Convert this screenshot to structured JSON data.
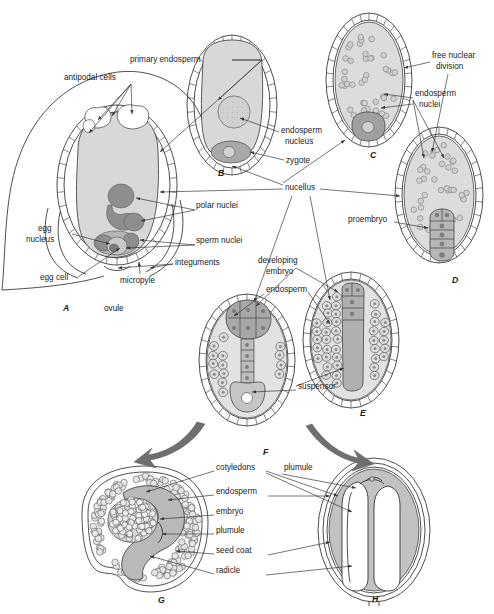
{
  "figure": {
    "panel_count": 8
  },
  "colors": {
    "background": "#ffffff",
    "ink": "#1a1a1a",
    "cytoplasm_light": "#d8d8d6",
    "cytoplasm_mid": "#c4c4c2",
    "nucleus_dark": "#8e8e8e",
    "nucleus_darker": "#777777",
    "cellwall": "#ffffff",
    "arrow_gray": "#6f6f6f",
    "leader": "#3a3a3a"
  },
  "panels": [
    {
      "id": "A",
      "label": "A",
      "x": 63,
      "y": 311,
      "caption": "ovule with mature embryo sac"
    },
    {
      "id": "B",
      "label": "B",
      "x": 218,
      "y": 176,
      "caption": "zygote and primary endosperm"
    },
    {
      "id": "C",
      "label": "C",
      "x": 370,
      "y": 158,
      "caption": "free nuclear endosperm"
    },
    {
      "id": "D",
      "label": "D",
      "x": 452,
      "y": 283,
      "caption": "proembryo stage"
    },
    {
      "id": "E",
      "label": "E",
      "x": 360,
      "y": 416,
      "caption": "elongating embryo"
    },
    {
      "id": "F",
      "label": "F",
      "x": 263,
      "y": 455,
      "caption": "embryo with suspensor"
    },
    {
      "id": "G",
      "label": "G",
      "x": 158,
      "y": 603,
      "caption": "mature seed, curved embryo"
    },
    {
      "id": "H",
      "label": "H",
      "x": 372,
      "y": 602,
      "caption": "mature seed, straight embryo"
    }
  ],
  "labels": [
    {
      "name": "antipodal-cells",
      "text": "antipodal cells",
      "x": 64,
      "y": 80,
      "anchor": "start"
    },
    {
      "name": "primary-endosperm",
      "text": "primary endosperm",
      "x": 130,
      "y": 62,
      "anchor": "start"
    },
    {
      "name": "free-nuclear-division-1",
      "text": "free nuclear",
      "x": 432,
      "y": 58,
      "anchor": "start"
    },
    {
      "name": "free-nuclear-division-2",
      "text": "division",
      "x": 436,
      "y": 69,
      "anchor": "start"
    },
    {
      "name": "endosperm-nuclei-1",
      "text": "endosperm",
      "x": 415,
      "y": 96,
      "anchor": "start"
    },
    {
      "name": "endosperm-nuclei-2",
      "text": "nuclei",
      "x": 419,
      "y": 107,
      "anchor": "start"
    },
    {
      "name": "endosperm-nucleus-1",
      "text": "endosperm",
      "x": 281,
      "y": 133,
      "anchor": "start"
    },
    {
      "name": "endosperm-nucleus-2",
      "text": "nucleus",
      "x": 285,
      "y": 144,
      "anchor": "start"
    },
    {
      "name": "zygote",
      "text": "zygote",
      "x": 286,
      "y": 163,
      "anchor": "start"
    },
    {
      "name": "nucellus",
      "text": "nucellus",
      "x": 285,
      "y": 190,
      "anchor": "start"
    },
    {
      "name": "polar-nuclei",
      "text": "polar nuclei",
      "x": 196,
      "y": 208,
      "anchor": "start"
    },
    {
      "name": "sperm-nuclei",
      "text": "sperm nuclei",
      "x": 196,
      "y": 243,
      "anchor": "start"
    },
    {
      "name": "egg-nucleus-1",
      "text": "egg",
      "x": 38,
      "y": 231,
      "anchor": "start"
    },
    {
      "name": "egg-nucleus-2",
      "text": "nucleus",
      "x": 26,
      "y": 242,
      "anchor": "start"
    },
    {
      "name": "egg-cell",
      "text": "egg cell",
      "x": 40,
      "y": 280,
      "anchor": "start"
    },
    {
      "name": "micropyle",
      "text": "micropyle",
      "x": 120,
      "y": 283,
      "anchor": "start"
    },
    {
      "name": "integuments",
      "text": "integuments",
      "x": 175,
      "y": 265,
      "anchor": "start"
    },
    {
      "name": "ovule",
      "text": "ovule",
      "x": 104,
      "y": 311,
      "anchor": "start"
    },
    {
      "name": "proembryo",
      "text": "proembryo",
      "x": 348,
      "y": 222,
      "anchor": "start"
    },
    {
      "name": "developing-embryo-1",
      "text": "developing",
      "x": 258,
      "y": 263,
      "anchor": "start"
    },
    {
      "name": "developing-embryo-2",
      "text": "embryo",
      "x": 266,
      "y": 274,
      "anchor": "start"
    },
    {
      "name": "endosperm-F",
      "text": "endosperm",
      "x": 266,
      "y": 292,
      "anchor": "start"
    },
    {
      "name": "suspensor",
      "text": "suspensor",
      "x": 298,
      "y": 389,
      "anchor": "start"
    },
    {
      "name": "cotyledons",
      "text": "cotyledons",
      "x": 216,
      "y": 470,
      "anchor": "start"
    },
    {
      "name": "plumule-top",
      "text": "plumule",
      "x": 284,
      "y": 470,
      "anchor": "start"
    },
    {
      "name": "endosperm-G",
      "text": "endosperm",
      "x": 216,
      "y": 494,
      "anchor": "start"
    },
    {
      "name": "embryo-G",
      "text": "embryo",
      "x": 216,
      "y": 514,
      "anchor": "start"
    },
    {
      "name": "plumule-G",
      "text": "plumule",
      "x": 216,
      "y": 533,
      "anchor": "start"
    },
    {
      "name": "seed-coat",
      "text": "seed coat",
      "x": 216,
      "y": 553,
      "anchor": "start"
    },
    {
      "name": "radicle",
      "text": "radicle",
      "x": 216,
      "y": 573,
      "anchor": "start"
    }
  ]
}
